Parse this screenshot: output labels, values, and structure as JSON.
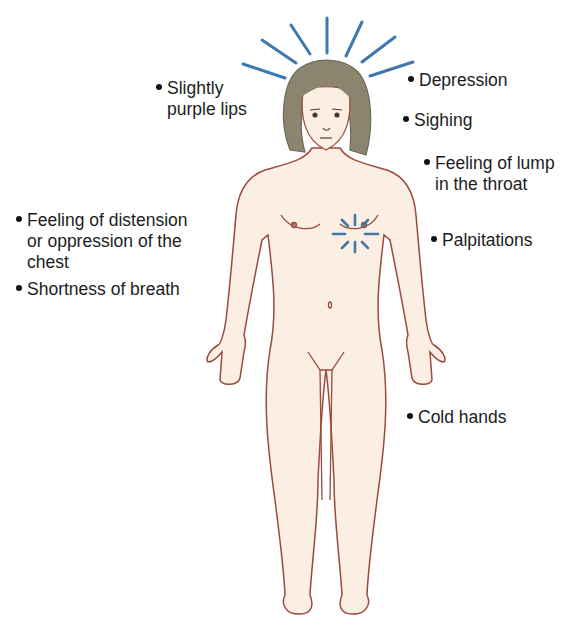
{
  "diagram": {
    "type": "symptom-body-map",
    "colors": {
      "skin": "#fbeee2",
      "outline": "#9b4a3c",
      "hair": "#8b8570",
      "accent_lines": "#3f78ad",
      "text": "#1c1c1c"
    },
    "labels": [
      {
        "id": "purple-lips",
        "lines": [
          "Slightly",
          "purple lips"
        ]
      },
      {
        "id": "depression",
        "lines": [
          "Depression"
        ]
      },
      {
        "id": "sighing",
        "lines": [
          "Sighing"
        ]
      },
      {
        "id": "lump-throat",
        "lines": [
          "Feeling of lump",
          "in the throat"
        ]
      },
      {
        "id": "chest-distension",
        "lines": [
          "Feeling of distension",
          "or oppression of the",
          "chest"
        ]
      },
      {
        "id": "shortness-breath",
        "lines": [
          "Shortness of breath"
        ]
      },
      {
        "id": "palpitations",
        "lines": [
          "Palpitations"
        ]
      },
      {
        "id": "cold-hands",
        "lines": [
          "Cold hands"
        ]
      }
    ]
  }
}
